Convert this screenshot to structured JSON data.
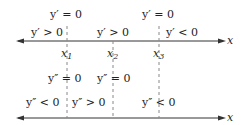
{
  "diagram": {
    "top_axis": {
      "axis_label": "x",
      "points": [
        {
          "name": "x",
          "sub": "1"
        },
        {
          "name": "x",
          "sub": "2"
        },
        {
          "name": "x",
          "sub": "3"
        }
      ],
      "critical_labels": [
        "y′ = 0",
        "y′ = 0"
      ],
      "interval_labels": [
        "y′ > 0",
        "y′ > 0",
        "y′ < 0"
      ]
    },
    "bottom_axis": {
      "axis_label": "x",
      "critical_labels": [
        "y″ = 0",
        "y″ = 0"
      ],
      "interval_labels": [
        "y″ < 0",
        "y″ > 0",
        "y″ < 0"
      ]
    },
    "colors": {
      "line": "#333333",
      "dashed": "#888888"
    }
  }
}
